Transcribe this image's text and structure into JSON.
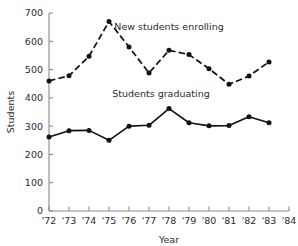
{
  "chart_data": {
    "type": "line",
    "title": "",
    "xlabel": "Year",
    "ylabel": "Students",
    "xlim": [
      1972,
      1984
    ],
    "ylim": [
      0,
      700
    ],
    "grid": false,
    "legend_position": "inline-annotation",
    "x": [
      1972,
      1973,
      1974,
      1975,
      1976,
      1977,
      1978,
      1979,
      1980,
      1981,
      1982,
      1983
    ],
    "xtick_labels": [
      "'72",
      "'73",
      "'74",
      "'75",
      "'76",
      "'77",
      "'78",
      "'79",
      "'80",
      "'81",
      "'82",
      "'83",
      "'84"
    ],
    "xtick_values": [
      1972,
      1973,
      1974,
      1975,
      1976,
      1977,
      1978,
      1979,
      1980,
      1981,
      1982,
      1983,
      1984
    ],
    "ytick_labels": [
      "0",
      "100",
      "200",
      "300",
      "400",
      "500",
      "600",
      "700"
    ],
    "ytick_values": [
      0,
      100,
      200,
      300,
      400,
      500,
      600,
      700
    ],
    "series": [
      {
        "name": "New students enrolling",
        "style": "dashed",
        "marker": "filled-circle",
        "color": "#111111",
        "values": [
          460,
          478,
          547,
          670,
          580,
          488,
          568,
          553,
          503,
          448,
          477,
          527
        ]
      },
      {
        "name": "Students graduating",
        "style": "solid",
        "marker": "filled-circle",
        "color": "#111111",
        "values": [
          262,
          284,
          285,
          250,
          300,
          303,
          362,
          312,
          301,
          302,
          333,
          312
        ]
      }
    ],
    "annotations": [
      {
        "text": "New students enrolling",
        "x": 1978.0,
        "y": 640
      },
      {
        "text": "Students graduating",
        "x": 1977.6,
        "y": 402
      }
    ]
  },
  "axis": {
    "y_title": "Students",
    "x_title": "Year"
  },
  "colors": {
    "axis": "#8a8a8a",
    "data": "#111111",
    "text": "#2b2b2b",
    "background": "#ffffff"
  }
}
